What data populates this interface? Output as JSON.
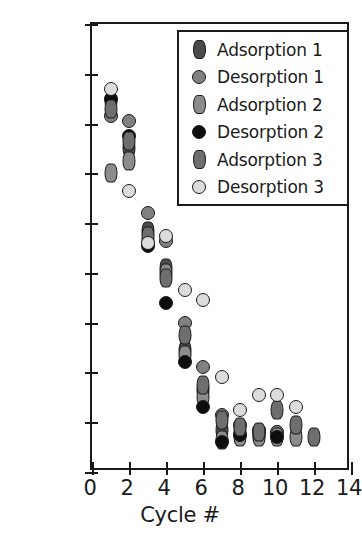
{
  "chart_data": {
    "type": "scatter",
    "title": "",
    "xlabel": "Cycle #",
    "ylabel_html": "CO<sub>2</sub> Capture Capacity (mol/kg)",
    "ylabel": "CO2 Capture Capacity (mol/kg)",
    "xlim": [
      0,
      14
    ],
    "ylim": [
      0.0,
      1.8
    ],
    "xticks": [
      "0",
      "2",
      "4",
      "6",
      "8",
      "10",
      "12",
      "14"
    ],
    "xtick_values": [
      0,
      2,
      4,
      6,
      8,
      10,
      12,
      14
    ],
    "yticks": [
      "0.0",
      "0.2",
      "0.4",
      "0.6",
      "0.8",
      "1.0",
      "1.2",
      "1.4",
      "1.6",
      "1.8"
    ],
    "ytick_values": [
      0.0,
      0.2,
      0.4,
      0.6,
      0.8,
      1.0,
      1.2,
      1.4,
      1.6,
      1.8
    ],
    "grid": false,
    "legend_position": "upper right",
    "series": [
      {
        "name": "Adsorption 1",
        "marker": "diamond",
        "color": "#4a4a4a",
        "edge_color": "#1c1c1c",
        "x": [
          1,
          2,
          3,
          4,
          5,
          6,
          7,
          8,
          9,
          10
        ],
        "y": [
          1.49,
          1.3,
          0.97,
          0.82,
          0.49,
          0.33,
          0.17,
          0.16,
          0.15,
          0.15
        ]
      },
      {
        "name": "Desorption 1",
        "marker": "circle",
        "color": "#808080",
        "edge_color": "#1c1c1c",
        "x": [
          1,
          2,
          3,
          4,
          5,
          6,
          7,
          8,
          9,
          10
        ],
        "y": [
          1.43,
          1.41,
          1.04,
          0.93,
          0.6,
          0.42,
          0.23,
          0.19,
          0.17,
          0.16
        ]
      },
      {
        "name": "Adsorption 2",
        "marker": "diamond",
        "color": "#8c8c8c",
        "edge_color": "#1c1c1c",
        "x": [
          1,
          2,
          3,
          4,
          5,
          6,
          7,
          8,
          9,
          10,
          11
        ],
        "y": [
          1.2,
          1.25,
          0.93,
          0.8,
          0.47,
          0.3,
          0.13,
          0.14,
          0.14,
          0.14,
          0.14
        ]
      },
      {
        "name": "Desorption 2",
        "marker": "circle",
        "color": "#0d0d0d",
        "edge_color": "#1c1c1c",
        "x": [
          1,
          2,
          3,
          4,
          5,
          6,
          7,
          8,
          9,
          10
        ],
        "y": [
          1.5,
          1.35,
          0.91,
          0.68,
          0.44,
          0.26,
          0.12,
          0.15,
          0.16,
          0.14
        ]
      },
      {
        "name": "Adsorption 3",
        "marker": "diamond",
        "color": "#6e6e6e",
        "edge_color": "#1c1c1c",
        "x": [
          1,
          2,
          3,
          4,
          5,
          6,
          7,
          8,
          9,
          10,
          11,
          12
        ],
        "y": [
          1.46,
          1.33,
          0.95,
          0.78,
          0.55,
          0.35,
          0.21,
          0.18,
          0.16,
          0.25,
          0.19,
          0.14
        ]
      },
      {
        "name": "Desorption 3",
        "marker": "circle",
        "color": "#dcdcdc",
        "edge_color": "#1c1c1c",
        "x": [
          1,
          2,
          3,
          4,
          5,
          6,
          7,
          8,
          9,
          10,
          11
        ],
        "y": [
          1.54,
          1.13,
          0.92,
          0.95,
          0.73,
          0.69,
          0.38,
          0.25,
          0.31,
          0.31,
          0.26
        ]
      }
    ]
  },
  "legend": {
    "entries": [
      {
        "label": "Adsorption 1"
      },
      {
        "label": "Desorption 1"
      },
      {
        "label": "Adsorption 2"
      },
      {
        "label": "Desorption 2"
      },
      {
        "label": "Adsorption 3"
      },
      {
        "label": "Desorption 3"
      }
    ]
  }
}
